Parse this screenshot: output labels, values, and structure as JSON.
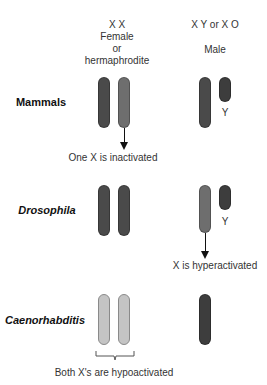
{
  "header": {
    "female": {
      "genotype": "X X",
      "line1": "Female",
      "line2": "or",
      "line3": "hermaphrodite"
    },
    "male": {
      "genotype": "X Y or X O",
      "label": "Male"
    }
  },
  "rows": [
    {
      "organism": "Mammals",
      "italic": false,
      "female_chromosomes": [
        {
          "color": "#4a4a4a"
        },
        {
          "color": "#6e6e6e"
        }
      ],
      "male_chromosomes": [
        {
          "name": "X",
          "color": "#4a4a4a"
        },
        {
          "name": "Y",
          "color": "#3d3d3d"
        }
      ],
      "y_label": "Y",
      "annotation": "One X is inactivated"
    },
    {
      "organism": "Drosophila",
      "italic": true,
      "female_chromosomes": [
        {
          "color": "#4a4a4a"
        },
        {
          "color": "#4a4a4a"
        }
      ],
      "male_chromosomes": [
        {
          "name": "X",
          "color": "#6e6e6e"
        },
        {
          "name": "Y",
          "color": "#3d3d3d"
        }
      ],
      "y_label": "Y",
      "annotation": "X is hyperactivated"
    },
    {
      "organism": "Caenorhabditis",
      "italic": true,
      "female_chromosomes": [
        {
          "color": "#c4c4c4"
        },
        {
          "color": "#c4c4c4"
        }
      ],
      "male_chromosomes": [
        {
          "name": "X",
          "color": "#3d3d3d"
        }
      ],
      "annotation": "Both X's are hypoactivated"
    }
  ]
}
